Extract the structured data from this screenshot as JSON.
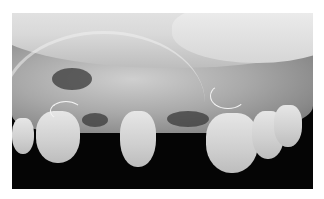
{
  "image": {
    "alt": "Grayscale clinical photograph of the upper jaw with a clear removable partial denture and wire clasps, showing remaining teeth and healing gingiva",
    "colors": {
      "background": "#ffffff",
      "photo_frame": "#050505",
      "soft_tissue": "#a9a9a9",
      "teeth": "#d9d9d9"
    }
  }
}
